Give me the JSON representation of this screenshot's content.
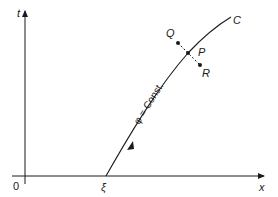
{
  "diagram": {
    "axes": {
      "vertical_label": "t",
      "horizontal_label": "x",
      "origin_label": "0"
    },
    "curve": {
      "name": "C",
      "start_label": "ξ",
      "annotation": "φ = Const."
    },
    "points": {
      "on_curve": "P",
      "above": "Q",
      "below": "R"
    },
    "colors": {
      "ink": "#1a1a1a",
      "background": "#ffffff"
    }
  }
}
